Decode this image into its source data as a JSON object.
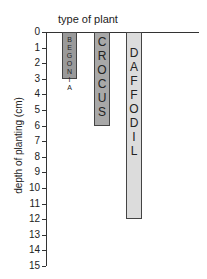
{
  "chart_data": {
    "type": "bar",
    "orientation": "vertical-down",
    "title": "type of plant",
    "xlabel": "type of plant",
    "ylabel": "depth of planting (cm)",
    "categories": [
      "BEGONIA",
      "CROCUS",
      "DAFFODIL"
    ],
    "values": [
      3,
      6,
      12
    ],
    "ylim": [
      0,
      15
    ],
    "yticks": [
      0,
      1,
      2,
      3,
      4,
      5,
      6,
      7,
      8,
      9,
      10,
      11,
      12,
      13,
      14,
      15
    ],
    "grid": false,
    "legend": null,
    "colors": [
      "#9a9a9a",
      "#a8a8a8",
      "#dcdcdc"
    ]
  }
}
